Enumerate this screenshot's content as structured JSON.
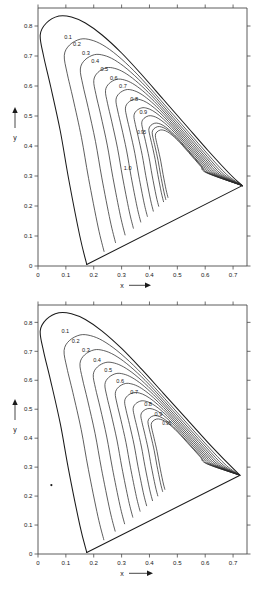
{
  "document": {
    "kind": "figure-pair",
    "background": "#ffffff",
    "ink": "#1a1a1a"
  },
  "chart_data": [
    {
      "id": "chart-top",
      "type": "line",
      "title": "",
      "xlabel": "x",
      "ylabel": "y",
      "xlabel_suffix": "→",
      "ylabel_prefix": "↑",
      "xlim": [
        0,
        0.75
      ],
      "ylim": [
        0,
        0.86
      ],
      "xticks": [
        0,
        0.1,
        0.2,
        0.3,
        0.4,
        0.5,
        0.6,
        0.7
      ],
      "yticks": [
        0,
        0.1,
        0.2,
        0.3,
        0.4,
        0.5,
        0.6,
        0.7,
        0.8
      ],
      "xticklabels": [
        "0",
        "0.1",
        "0.2",
        "0.3",
        "0.4",
        "0.5",
        "0.6",
        "0.7"
      ],
      "yticklabels": [
        "0",
        "0.1",
        "0.2",
        "0.3",
        "0.4",
        "0.5",
        "0.6",
        "0.7",
        "0.8"
      ],
      "grid": false,
      "legend": "none",
      "frame": "box-with-outside-ticks",
      "boundary_name": "spectral-locus",
      "boundary_points": [
        [
          0.175,
          0.005
        ],
        [
          0.15,
          0.1
        ],
        [
          0.11,
          0.29
        ],
        [
          0.08,
          0.45
        ],
        [
          0.045,
          0.6
        ],
        [
          0.02,
          0.7
        ],
        [
          0.008,
          0.77
        ],
        [
          0.03,
          0.81
        ],
        [
          0.075,
          0.833
        ],
        [
          0.12,
          0.83
        ],
        [
          0.17,
          0.81
        ],
        [
          0.23,
          0.77
        ],
        [
          0.3,
          0.71
        ],
        [
          0.37,
          0.64
        ],
        [
          0.45,
          0.555
        ],
        [
          0.53,
          0.47
        ],
        [
          0.61,
          0.385
        ],
        [
          0.69,
          0.305
        ],
        [
          0.733,
          0.268
        ],
        [
          0.175,
          0.005
        ]
      ],
      "contour_levels": [
        0.1,
        0.2,
        0.3,
        0.4,
        0.5,
        0.6,
        0.7,
        0.8,
        0.9,
        0.95,
        1.0
      ],
      "contour_label_texts": [
        "0.1",
        "0.2",
        "0.3",
        "0.4",
        "0.5",
        "0.6",
        "0.7",
        "0.8",
        "0.9",
        "0.95",
        "1.0"
      ],
      "contour_label_positions": [
        [
          0.108,
          0.757
        ],
        [
          0.14,
          0.733
        ],
        [
          0.172,
          0.705
        ],
        [
          0.205,
          0.678
        ],
        [
          0.238,
          0.65
        ],
        [
          0.272,
          0.62
        ],
        [
          0.305,
          0.592
        ],
        [
          0.345,
          0.55
        ],
        [
          0.378,
          0.508
        ],
        [
          0.372,
          0.44
        ],
        [
          0.322,
          0.32
        ]
      ],
      "convergence_point": [
        0.733,
        0.268
      ],
      "description": "Nested contour curves of constant purity inside the CIE 1931 chromaticity locus, all converging at the long-wavelength corner."
    },
    {
      "id": "chart-bottom",
      "type": "line",
      "title": "",
      "xlabel": "x",
      "ylabel": "y",
      "xlabel_suffix": "→",
      "ylabel_prefix": "↑",
      "xlim": [
        0,
        0.75
      ],
      "ylim": [
        0,
        0.86
      ],
      "xticks": [
        0,
        0.1,
        0.2,
        0.3,
        0.4,
        0.5,
        0.6,
        0.7
      ],
      "yticks": [
        0,
        0.1,
        0.2,
        0.3,
        0.4,
        0.5,
        0.6,
        0.7,
        0.8
      ],
      "xticklabels": [
        "0",
        "0.1",
        "0.2",
        "0.3",
        "0.4",
        "0.5",
        "0.6",
        "0.7"
      ],
      "yticklabels": [
        "0",
        "0.1",
        "0.2",
        "0.3",
        "0.4",
        "0.5",
        "0.6",
        "0.7",
        "0.8"
      ],
      "grid": false,
      "legend": "none",
      "frame": "box-with-outside-ticks",
      "boundary_name": "spectral-locus",
      "boundary_points": [
        [
          0.175,
          0.005
        ],
        [
          0.15,
          0.1
        ],
        [
          0.11,
          0.29
        ],
        [
          0.08,
          0.45
        ],
        [
          0.045,
          0.6
        ],
        [
          0.02,
          0.7
        ],
        [
          0.008,
          0.77
        ],
        [
          0.03,
          0.81
        ],
        [
          0.075,
          0.833
        ],
        [
          0.12,
          0.83
        ],
        [
          0.17,
          0.81
        ],
        [
          0.23,
          0.77
        ],
        [
          0.3,
          0.71
        ],
        [
          0.37,
          0.64
        ],
        [
          0.45,
          0.555
        ],
        [
          0.53,
          0.47
        ],
        [
          0.61,
          0.385
        ],
        [
          0.69,
          0.305
        ],
        [
          0.725,
          0.272
        ],
        [
          0.175,
          0.005
        ]
      ],
      "contour_levels": [
        0.1,
        0.2,
        0.3,
        0.4,
        0.5,
        0.6,
        0.7,
        0.8,
        0.9,
        0.95
      ],
      "contour_label_texts": [
        "0.1",
        "0.2",
        "0.3",
        "0.4",
        "0.5",
        "0.6",
        "0.7",
        "0.8",
        "0.9",
        "0.95"
      ],
      "contour_label_positions": [
        [
          0.098,
          0.762
        ],
        [
          0.135,
          0.73
        ],
        [
          0.172,
          0.698
        ],
        [
          0.212,
          0.662
        ],
        [
          0.252,
          0.628
        ],
        [
          0.295,
          0.592
        ],
        [
          0.345,
          0.552
        ],
        [
          0.395,
          0.512
        ],
        [
          0.432,
          0.478
        ],
        [
          0.462,
          0.447
        ]
      ],
      "convergence_point": [
        0.725,
        0.272
      ],
      "marker_name": "reference-point",
      "marker_point": [
        0.048,
        0.238
      ],
      "description": "Second CIE 1931 chromaticity diagram with a nested family of constant-purity contours and a small reference point marker near x=0.05, y=0.24."
    }
  ]
}
